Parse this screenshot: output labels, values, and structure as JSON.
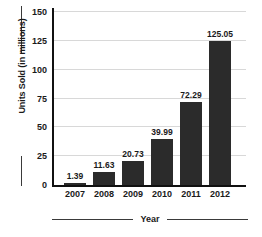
{
  "chart_data": {
    "type": "bar",
    "title": "",
    "subtitle": "",
    "xlabel": "Year",
    "ylabel": "Units Sold (in millions)",
    "categories": [
      "2007",
      "2008",
      "2009",
      "2010",
      "2011",
      "2012"
    ],
    "values": [
      1.39,
      11.63,
      20.73,
      39.99,
      72.29,
      125.05
    ],
    "value_labels": [
      "1.39",
      "11.63",
      "20.73",
      "39.99",
      "72.29",
      "125.05"
    ],
    "series": [
      {
        "name": "Units Sold",
        "values": [
          1.39,
          11.63,
          20.73,
          39.99,
          72.29,
          125.05
        ]
      }
    ],
    "ylim": [
      0,
      150
    ],
    "yticks": [
      0,
      25,
      50,
      75,
      100,
      125,
      150
    ],
    "ytick_labels": [
      "0",
      "25",
      "50",
      "75",
      "100",
      "125",
      "150"
    ],
    "xtick_labels": [
      "2007",
      "2008",
      "2009",
      "2010",
      "2011",
      "2012"
    ],
    "grid": true,
    "grid_axis": "y",
    "legend": false,
    "legend_position": "none",
    "bar_color": "#2b2b2b",
    "grid_color": "#d8d8d8",
    "axis_color": "#111111",
    "background_color": "#ffffff",
    "text_color": "#1a1a1a"
  }
}
